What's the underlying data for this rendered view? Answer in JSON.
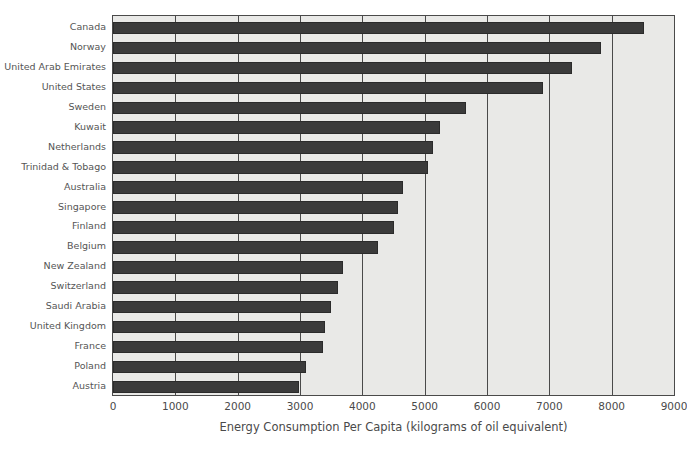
{
  "chart_data": {
    "type": "bar",
    "orientation": "horizontal",
    "title": "",
    "xlabel": "Energy Consumption Per Capita (kilograms of oil equivalent)",
    "ylabel": "",
    "xlim": [
      0,
      9000
    ],
    "xticks": [
      0,
      1000,
      2000,
      3000,
      4000,
      5000,
      6000,
      7000,
      8000,
      9000
    ],
    "xtick_labels": [
      "0",
      "1000",
      "2000",
      "3000",
      "4000",
      "5000",
      "6000",
      "7000",
      "8000",
      "9000"
    ],
    "grid": "vertical",
    "legend": null,
    "bar_color": "#3b3b3b",
    "plot_background": "#e9e9e7",
    "categories": [
      "Canada",
      "Norway",
      "United Arab Emirates",
      "United States",
      "Sweden",
      "Kuwait",
      "Netherlands",
      "Trinidad & Tobago",
      "Australia",
      "Singapore",
      "Finland",
      "Belgium",
      "New Zealand",
      "Switzerland",
      "Saudi Arabia",
      "United Kingdom",
      "France",
      "Poland",
      "Austria"
    ],
    "values": [
      8520,
      7830,
      7370,
      6900,
      5660,
      5240,
      5130,
      5050,
      4660,
      4570,
      4500,
      4250,
      3690,
      3610,
      3500,
      3400,
      3370,
      3100,
      2980
    ]
  }
}
